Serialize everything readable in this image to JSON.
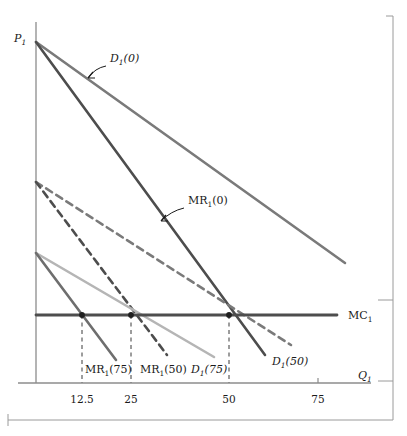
{
  "figure": {
    "type": "line-diagram",
    "background": "#ffffff",
    "axes": {
      "y_axis_label": "P",
      "y_axis_label_sub": "1",
      "x_axis_label": "Q",
      "x_axis_label_sub": "1",
      "x_ticks": [
        {
          "label": "12.5",
          "x": 82
        },
        {
          "label": "25",
          "x": 131
        },
        {
          "label": "50",
          "x": 229
        },
        {
          "label": "75",
          "x": 318
        }
      ],
      "axis_color": "#8c8c8c",
      "origin": {
        "x": 36,
        "y": 383
      }
    },
    "curves": [
      {
        "name": "D1(0)",
        "label": "D",
        "label_sub": "1",
        "label_paren": "(0)",
        "style": "solid",
        "color": "#7a7a7a",
        "width": 2.6,
        "x1": 36,
        "y1": 42,
        "x2": 345,
        "y2": 263
      },
      {
        "name": "MR1(0)",
        "label": "MR",
        "label_sub": "1",
        "label_paren": "(0)",
        "style": "solid",
        "color": "#4d4d4d",
        "width": 2.6,
        "x1": 36,
        "y1": 42,
        "x2": 265,
        "y2": 355
      },
      {
        "name": "D1(50)",
        "label": "D",
        "label_sub": "1",
        "label_paren": "(50)",
        "style": "dashed",
        "color": "#7a7a7a",
        "width": 2.6,
        "x1": 36,
        "y1": 182,
        "x2": 291,
        "y2": 345
      },
      {
        "name": "MR1(50)",
        "label": "MR",
        "label_sub": "1",
        "label_paren": "(50)",
        "style": "dashed",
        "color": "#4d4d4d",
        "width": 2.6,
        "x1": 36,
        "y1": 182,
        "x2": 167,
        "y2": 355
      },
      {
        "name": "D1(75)",
        "label": "D",
        "label_sub": "1",
        "label_paren": "(75)",
        "style": "solid",
        "color": "#b5b5b5",
        "width": 2.6,
        "x1": 36,
        "y1": 253,
        "x2": 214,
        "y2": 357
      },
      {
        "name": "MR1(75)",
        "label": "MR",
        "label_sub": "1",
        "label_paren": "(75)",
        "style": "solid",
        "color": "#6e6e6e",
        "width": 2.6,
        "x1": 36,
        "y1": 253,
        "x2": 116,
        "y2": 360
      },
      {
        "name": "MC1",
        "label": "MC",
        "label_sub": "1",
        "label_paren": "",
        "style": "solid",
        "color": "#4d4d4d",
        "width": 2.8,
        "x1": 36,
        "y1": 315,
        "x2": 337,
        "y2": 315
      }
    ],
    "equilibrium_points": [
      {
        "x": 82,
        "y": 315,
        "quantity": "12.5"
      },
      {
        "x": 131,
        "y": 315,
        "quantity": "25"
      },
      {
        "x": 229,
        "y": 315,
        "quantity": "50"
      }
    ],
    "drop_lines": [
      {
        "x": 82,
        "y_top": 315,
        "y_bottom": 383
      },
      {
        "x": 131,
        "y_top": 315,
        "y_bottom": 383
      },
      {
        "x": 229,
        "y_top": 315,
        "y_bottom": 383
      }
    ],
    "curve_labels": [
      {
        "name": "D1(0)-label",
        "text": "D",
        "sub": "1",
        "paren": "(0)",
        "x": 110,
        "y": 62,
        "arrow": {
          "x1": 106,
          "y1": 68,
          "cx": 96,
          "cy": 70,
          "x2": 88,
          "y2": 80
        }
      },
      {
        "name": "MR1(0)-label",
        "text": "MR",
        "sub": "1",
        "paren": "(0)",
        "x": 188,
        "y": 204,
        "arrow": {
          "x1": 183,
          "y1": 209,
          "cx": 172,
          "cy": 212,
          "x2": 162,
          "y2": 222
        }
      },
      {
        "name": "MR1(75)-label",
        "text": "MR",
        "sub": "1",
        "paren": "(75)",
        "x": 85,
        "y": 373,
        "arrow": null
      },
      {
        "name": "MR1(50)-label",
        "text": "MR",
        "sub": "1",
        "paren": "(50)",
        "x": 140,
        "y": 373,
        "arrow": null
      },
      {
        "name": "D1(75)-label",
        "text": "D",
        "sub": "1",
        "paren": "(75)",
        "x": 191,
        "y": 373,
        "arrow": null
      },
      {
        "name": "D1(50)-label",
        "text": "D",
        "sub": "1",
        "paren": "(50)",
        "x": 272,
        "y": 365,
        "arrow": null
      },
      {
        "name": "MC1-label",
        "text": "MC",
        "sub": "1",
        "paren": "",
        "x": 348,
        "y": 319,
        "arrow": null
      }
    ],
    "frame": {
      "color": "#9a9a9a",
      "right_x": 393,
      "top_y": 16,
      "bottom_y": 420,
      "left_x": 8,
      "tick_marks": [
        {
          "y": 16,
          "side": "top"
        },
        {
          "y": 300,
          "side": "right"
        },
        {
          "y": 381,
          "side": "right"
        }
      ]
    }
  },
  "chart_data": {
    "type": "line",
    "title": "",
    "xlabel": "Q1",
    "ylabel": "P1",
    "xlim": [
      0,
      85
    ],
    "ylim": [
      0,
      100
    ],
    "grid": false,
    "legend": "inline-annotations",
    "series": [
      {
        "name": "D1(0)",
        "style": "solid",
        "color": "#7a7a7a",
        "points": [
          [
            0,
            100
          ],
          [
            85,
            20
          ]
        ]
      },
      {
        "name": "MR1(0)",
        "style": "solid",
        "color": "#4d4d4d",
        "points": [
          [
            0,
            100
          ],
          [
            63,
            0
          ]
        ]
      },
      {
        "name": "D1(50)",
        "style": "dashed",
        "color": "#7a7a7a",
        "points": [
          [
            0,
            59
          ],
          [
            70,
            3
          ]
        ]
      },
      {
        "name": "MR1(50)",
        "style": "dashed",
        "color": "#4d4d4d",
        "points": [
          [
            0,
            59
          ],
          [
            36,
            0
          ]
        ]
      },
      {
        "name": "D1(75)",
        "style": "solid",
        "color": "#b5b5b5",
        "points": [
          [
            0,
            40
          ],
          [
            49,
            0
          ]
        ]
      },
      {
        "name": "MR1(75)",
        "style": "solid",
        "color": "#6e6e6e",
        "points": [
          [
            0,
            40
          ],
          [
            22,
            0
          ]
        ]
      },
      {
        "name": "MC1",
        "style": "solid",
        "color": "#4d4d4d",
        "points": [
          [
            0,
            22
          ],
          [
            83,
            22
          ]
        ]
      }
    ],
    "categories": [
      "12.5",
      "25",
      "50",
      "75"
    ],
    "annotations": [
      {
        "text": "D1(0)",
        "at": [
          14,
          88
        ]
      },
      {
        "text": "MR1(0)",
        "at": [
          42,
          48
        ]
      },
      {
        "text": "MR1(75)",
        "at": [
          14,
          3
        ]
      },
      {
        "text": "MR1(50)",
        "at": [
          29,
          3
        ]
      },
      {
        "text": "D1(75)",
        "at": [
          43,
          3
        ]
      },
      {
        "text": "D1(50)",
        "at": [
          65,
          5
        ]
      },
      {
        "text": "MC1",
        "at": [
          85,
          22
        ]
      }
    ],
    "equilibria": [
      {
        "quantity": 12.5,
        "price": 22,
        "curve": "MR1(75)"
      },
      {
        "quantity": 25,
        "price": 22,
        "curve": "MR1(50)"
      },
      {
        "quantity": 50,
        "price": 22,
        "curve": "MR1(0)"
      }
    ]
  }
}
